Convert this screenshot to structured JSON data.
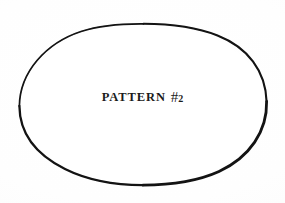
{
  "page": {
    "width_px": 285,
    "height_px": 203,
    "background_color": "#fdfdfd",
    "ink_color": "#141414"
  },
  "figure": {
    "shape_name": "ellipse",
    "shape_label": "hand-drawn oval outline",
    "stroke_color": "#141414",
    "fill_color": "#ffffff",
    "bounds": {
      "left_px": 19,
      "top_px": 24,
      "right_px": 267,
      "bottom_px": 185,
      "center_x_px": 143,
      "center_y_px": 104,
      "radius_x_px": 124,
      "radius_y_px": 80
    },
    "stroke_width_px_min": 1.4,
    "stroke_width_px_max": 3.0
  },
  "caption": {
    "full_text": "PATTERN #2",
    "word": "PATTERN",
    "hash_symbol": "#",
    "number": "2",
    "color": "#1b1b1b",
    "align": "center",
    "baseline_y_px": 105
  }
}
